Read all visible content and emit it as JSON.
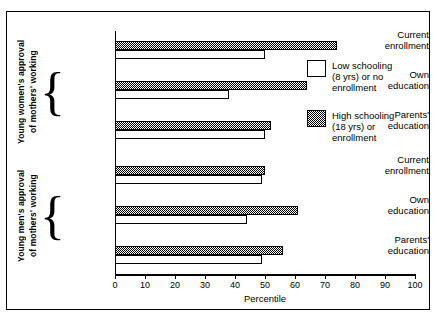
{
  "chart_data": {
    "type": "bar",
    "orientation": "horizontal",
    "title": "",
    "xlabel": "Percentile",
    "ylabel": "",
    "xlim": [
      0,
      100
    ],
    "xticks": [
      0,
      10,
      20,
      30,
      40,
      50,
      60,
      70,
      80,
      90,
      100
    ],
    "grid": false,
    "legend_position": "right",
    "series": [
      {
        "name": "Low schooling (8 yrs) or no enrollment",
        "fill": "white",
        "values": [
          50,
          38,
          50,
          49,
          44,
          49
        ]
      },
      {
        "name": "High schooling (18 yrs) or enrollment",
        "fill": "hatched",
        "values": [
          74,
          64,
          52,
          50,
          61,
          56
        ]
      }
    ],
    "categories": [
      "Current enrollment",
      "Own education",
      "Parents' education",
      "Current enrollment",
      "Own education",
      "Parents' education"
    ],
    "groups": [
      {
        "label": "Young women's approval of mothers' working",
        "categories": [
          "Current enrollment",
          "Own education",
          "Parents' education"
        ]
      },
      {
        "label": "Young men's approval of mothers' working",
        "categories": [
          "Current enrollment",
          "Own education",
          "Parents' education"
        ]
      }
    ]
  },
  "axis": {
    "x_title": "Percentile",
    "x_tick_labels": [
      "0",
      "10",
      "20",
      "30",
      "40",
      "50",
      "60",
      "70",
      "80",
      "90",
      "100"
    ]
  },
  "groups": {
    "women": {
      "label_line1": "Young women's approval",
      "label_line2": "of mothers' working",
      "cat1_line1": "Current",
      "cat1_line2": "enrollment",
      "cat2_line1": "Own",
      "cat2_line2": "education",
      "cat3_line1": "Parents'",
      "cat3_line2": "education"
    },
    "men": {
      "label_line1": "Young men's approval",
      "label_line2": "of mothers' working",
      "cat1_line1": "Current",
      "cat1_line2": "enrollment",
      "cat2_line1": "Own",
      "cat2_line2": "education",
      "cat3_line1": "Parents'",
      "cat3_line2": "education"
    }
  },
  "legend": {
    "low_line1": "Low schooling",
    "low_line2": "(8 yrs) or no",
    "low_line3": "enrollment",
    "high_line1": "High schooling",
    "high_line2": "(18 yrs) or",
    "high_line3": "enrollment"
  }
}
